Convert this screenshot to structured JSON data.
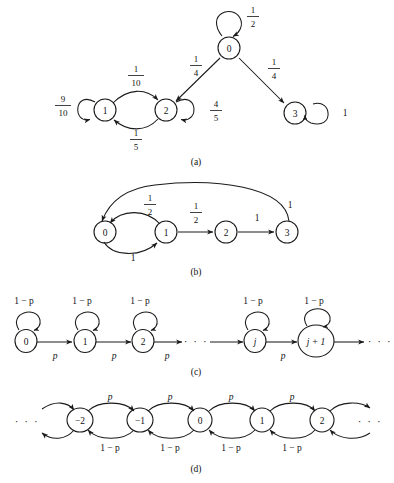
{
  "figure": {
    "type": "markov-chain-state-transition-diagrams",
    "panels": [
      {
        "id": "a",
        "caption": "(a)",
        "states": [
          {
            "id": "0",
            "label": "0",
            "x": 229,
            "y": 48
          },
          {
            "id": "1",
            "label": "1",
            "x": 105,
            "y": 110
          },
          {
            "id": "2",
            "label": "2",
            "x": 166,
            "y": 110
          },
          {
            "id": "3",
            "label": "3",
            "x": 295,
            "y": 113
          }
        ],
        "transitions": [
          {
            "from": "0",
            "to": "0",
            "kind": "self-loop",
            "label": "1/2",
            "numerator": "1",
            "denominator": "2",
            "label_x": 253,
            "label_y": 16
          },
          {
            "from": "0",
            "to": "2",
            "kind": "straight",
            "label": "1/4",
            "numerator": "1",
            "denominator": "4",
            "label_x": 196,
            "label_y": 65
          },
          {
            "from": "0",
            "to": "3",
            "kind": "straight",
            "label": "1/4",
            "numerator": "1",
            "denominator": "4",
            "label_x": 272,
            "label_y": 68
          },
          {
            "from": "1",
            "to": "1",
            "kind": "self-loop",
            "label": "9/10",
            "numerator": "9",
            "denominator": "10",
            "label_x": 63,
            "label_y": 105
          },
          {
            "from": "1",
            "to": "2",
            "kind": "arc-above",
            "label": "1/10",
            "numerator": "1",
            "denominator": "10",
            "label_x": 136,
            "label_y": 75
          },
          {
            "from": "2",
            "to": "1",
            "kind": "arc-below",
            "label": "1/5",
            "numerator": "1",
            "denominator": "5",
            "label_x": 136,
            "label_y": 139
          },
          {
            "from": "2",
            "to": "2",
            "kind": "self-loop",
            "label": "4/5",
            "numerator": "4",
            "denominator": "5",
            "label_x": 216,
            "label_y": 110
          },
          {
            "from": "3",
            "to": "3",
            "kind": "self-loop",
            "label": "1",
            "label_x": 345,
            "label_y": 113
          }
        ]
      },
      {
        "id": "b",
        "caption": "(b)",
        "states": [
          {
            "id": "0",
            "label": "0",
            "x": 105,
            "y": 232
          },
          {
            "id": "1",
            "label": "1",
            "x": 166,
            "y": 232
          },
          {
            "id": "2",
            "label": "2",
            "x": 226,
            "y": 232
          },
          {
            "id": "3",
            "label": "3",
            "x": 287,
            "y": 232
          }
        ],
        "transitions": [
          {
            "from": "0",
            "to": "1",
            "kind": "arc-above",
            "label": "1/2",
            "numerator": "1",
            "denominator": "2",
            "label_x": 150,
            "label_y": 204
          },
          {
            "from": "1",
            "to": "0",
            "kind": "arc-below",
            "label": "1",
            "label_x": 135,
            "label_y": 256
          },
          {
            "from": "1",
            "to": "2",
            "kind": "straight",
            "label": "1/2",
            "numerator": "1",
            "denominator": "2",
            "label_x": 196,
            "label_y": 212
          },
          {
            "from": "2",
            "to": "3",
            "kind": "straight",
            "label": "1",
            "label_x": 257,
            "label_y": 218
          },
          {
            "from": "3",
            "to": "0",
            "kind": "big-arc-above",
            "label": "1",
            "label_x": 288,
            "label_y": 206
          }
        ]
      },
      {
        "id": "c",
        "caption": "(c)",
        "states": [
          {
            "id": "0",
            "label": "0",
            "x": 26,
            "y": 340
          },
          {
            "id": "1",
            "label": "1",
            "x": 85,
            "y": 340
          },
          {
            "id": "2",
            "label": "2",
            "x": 143,
            "y": 340
          },
          {
            "id": "j",
            "label": "j",
            "italic": true,
            "x": 255,
            "y": 340
          },
          {
            "id": "j1",
            "label": "j + 1",
            "italic": true,
            "x": 316,
            "y": 340,
            "rx": 18
          }
        ],
        "ellipses": [
          {
            "label": "· · ·",
            "x": 196,
            "y": 340
          },
          {
            "label": "· · ·",
            "x": 378,
            "y": 340
          }
        ],
        "transitions": [
          {
            "from": "0",
            "to": "0",
            "kind": "self-loop-top",
            "label": "1 − p",
            "label_x": 24,
            "label_y": 301
          },
          {
            "from": "1",
            "to": "1",
            "kind": "self-loop-top",
            "label": "1 − p",
            "label_x": 82,
            "label_y": 301
          },
          {
            "from": "2",
            "to": "2",
            "kind": "self-loop-top",
            "label": "1 − p",
            "label_x": 140,
            "label_y": 301
          },
          {
            "from": "j",
            "to": "j",
            "kind": "self-loop-top",
            "label": "1 − p",
            "label_x": 253,
            "label_y": 301
          },
          {
            "from": "j1",
            "to": "j1",
            "kind": "self-loop-top",
            "label": "1 − p",
            "label_x": 314,
            "label_y": 301
          },
          {
            "from": "0",
            "to": "1",
            "kind": "straight",
            "label": "p",
            "italic": true,
            "label_x": 55,
            "label_y": 355
          },
          {
            "from": "1",
            "to": "2",
            "kind": "straight",
            "label": "p",
            "italic": true,
            "label_x": 114,
            "label_y": 355
          },
          {
            "from": "2",
            "to": "dots",
            "kind": "straight",
            "label": "p",
            "italic": true,
            "label_x": 167,
            "label_y": 355
          },
          {
            "from": "j",
            "to": "j1",
            "kind": "straight",
            "label": "p",
            "italic": true,
            "label_x": 283,
            "label_y": 355
          }
        ]
      },
      {
        "id": "d",
        "caption": "(d)",
        "states": [
          {
            "id": "-2",
            "label": "−2",
            "x": 80,
            "y": 420
          },
          {
            "id": "-1",
            "label": "−1",
            "x": 140,
            "y": 420
          },
          {
            "id": "0",
            "label": "0",
            "x": 200,
            "y": 420
          },
          {
            "id": "1",
            "label": "1",
            "x": 262,
            "y": 420
          },
          {
            "id": "2",
            "label": "2",
            "x": 322,
            "y": 420
          }
        ],
        "ellipses": [
          {
            "label": "· · ·",
            "x": 27,
            "y": 420
          },
          {
            "label": "· · ·",
            "x": 370,
            "y": 420
          }
        ],
        "transitions": [
          {
            "from": "-2",
            "to": "-1",
            "kind": "arc-above",
            "label": "p",
            "italic": true,
            "label_x": 110,
            "label_y": 397
          },
          {
            "from": "-1",
            "to": "0",
            "kind": "arc-above",
            "label": "p",
            "italic": true,
            "label_x": 170,
            "label_y": 397
          },
          {
            "from": "0",
            "to": "1",
            "kind": "arc-above",
            "label": "p",
            "italic": true,
            "label_x": 231,
            "label_y": 397
          },
          {
            "from": "1",
            "to": "2",
            "kind": "arc-above",
            "label": "p",
            "italic": true,
            "label_x": 292,
            "label_y": 397
          },
          {
            "from": "-1",
            "to": "-2",
            "kind": "arc-below",
            "label": "1 − p",
            "label_x": 110,
            "label_y": 448
          },
          {
            "from": "0",
            "to": "-1",
            "kind": "arc-below",
            "label": "1 − p",
            "label_x": 170,
            "label_y": 448
          },
          {
            "from": "1",
            "to": "0",
            "kind": "arc-below",
            "label": "1 − p",
            "label_x": 231,
            "label_y": 448
          },
          {
            "from": "2",
            "to": "1",
            "kind": "arc-below",
            "label": "1 − p",
            "label_x": 292,
            "label_y": 448
          }
        ]
      }
    ],
    "captions": [
      {
        "text": "(a)",
        "x": 196,
        "y": 162
      },
      {
        "text": "(b)",
        "x": 196,
        "y": 272
      },
      {
        "text": "(c)",
        "x": 196,
        "y": 372
      },
      {
        "text": "(d)",
        "x": 196,
        "y": 469
      }
    ],
    "colors": {
      "ink": "#1a1a1a",
      "background": "#ffffff"
    }
  }
}
